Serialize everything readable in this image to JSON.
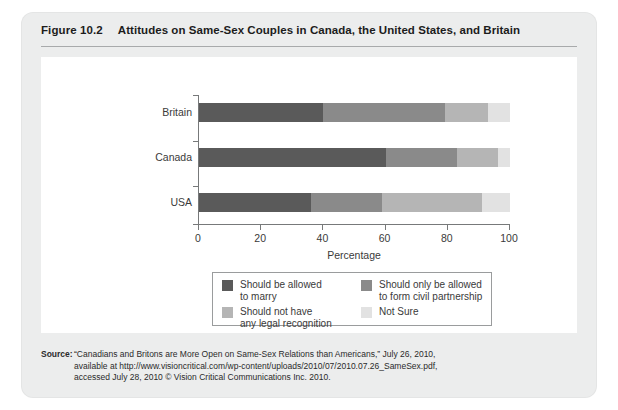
{
  "figure": {
    "number": "Figure 10.2",
    "title": "Attitudes on Same-Sex Couples in Canada, the United States, and Britain"
  },
  "chart_data": {
    "type": "bar",
    "orientation": "horizontal",
    "stacked": true,
    "title": "Attitudes on Same-Sex Couples in Canada, the United States, and Britain",
    "xlabel": "Percentage",
    "ylabel": "",
    "xlim": [
      0,
      100
    ],
    "xticks": [
      0,
      20,
      40,
      60,
      80,
      100
    ],
    "xtick_labels": [
      "0",
      "20",
      "40",
      "60",
      "80",
      "100"
    ],
    "grid": false,
    "legend_position": "bottom-center",
    "categories": [
      "Britain",
      "Canada",
      "USA"
    ],
    "series": [
      {
        "name": "Should be allowed to marry",
        "color": "#5a5a5a",
        "values": [
          40,
          60,
          36
        ]
      },
      {
        "name": "Should only be allowed to form civil partnership",
        "color": "#8a8a8a",
        "values": [
          39,
          23,
          23
        ]
      },
      {
        "name": "Should not have any legal recognition",
        "color": "#b5b5b5",
        "values": [
          14,
          13,
          32
        ]
      },
      {
        "name": "Not Sure",
        "color": "#e2e2e2",
        "values": [
          7,
          4,
          9
        ]
      }
    ]
  },
  "legend": {
    "entries": [
      {
        "label": "Should be allowed\nto marry",
        "color": "#5a5a5a"
      },
      {
        "label": "Should only be allowed\nto form civil partnership",
        "color": "#8a8a8a"
      },
      {
        "label": "Should not have\nany legal recognition",
        "color": "#b5b5b5"
      },
      {
        "label": "Not Sure",
        "color": "#e2e2e2"
      }
    ]
  },
  "source": {
    "label": "Source:",
    "lines": [
      "“Canadians and Britons are More Open on Same-Sex Relations than Americans,” July 26, 2010,",
      "available at http://www.visioncritical.com/wp-content/uploads/2010/07/2010.07.26_SameSex.pdf,",
      "accessed July 28, 2010 © Vision Critical Communications Inc. 2010."
    ]
  }
}
